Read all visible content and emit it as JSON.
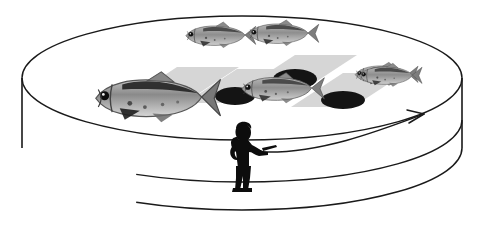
{
  "figure": {
    "kind": "illustration",
    "background_color": "#ffffff",
    "line_color": "#1a1a1a",
    "canvas": {
      "width": 482,
      "height": 243
    }
  },
  "tank": {
    "name": "circular-observation-tank",
    "shape": "cylinder",
    "stroke_color": "#1a1a1a",
    "stroke_width": 1.4,
    "fill_color": "none",
    "top_rim": {
      "cx": 242,
      "cy": 78,
      "rx": 220,
      "ry": 62
    },
    "inner_rim": {
      "cx": 242,
      "cy": 120,
      "rx": 220,
      "ry": 62
    },
    "bottom_rim": {
      "cx": 242,
      "cy": 148,
      "rx": 220,
      "ry": 62
    },
    "wall_left_x": 22,
    "wall_right_x": 462
  },
  "patches": {
    "name": "substrate-patches",
    "fill_color": "#d4d4d4",
    "count": 4,
    "items": [
      {
        "label": "patch-1",
        "cx": 182,
        "cy": 84,
        "w": 62,
        "h": 34,
        "skew": 26
      },
      {
        "label": "patch-2",
        "cx": 242,
        "cy": 86,
        "w": 62,
        "h": 34,
        "skew": 26
      },
      {
        "label": "patch-3",
        "cx": 300,
        "cy": 72,
        "w": 62,
        "h": 34,
        "skew": 26
      },
      {
        "label": "patch-4",
        "cx": 348,
        "cy": 90,
        "w": 62,
        "h": 34,
        "skew": 26
      }
    ]
  },
  "holes": {
    "name": "dark-ellipses",
    "fill_color": "#141414",
    "count": 4,
    "items": [
      {
        "label": "hole-1",
        "cx": 175,
        "cy": 93,
        "rx": 19,
        "ry": 8
      },
      {
        "label": "hole-2",
        "cx": 235,
        "cy": 96,
        "rx": 20,
        "ry": 9
      },
      {
        "label": "hole-3",
        "cx": 295,
        "cy": 79,
        "rx": 22,
        "ry": 10
      },
      {
        "label": "hole-4",
        "cx": 343,
        "cy": 100,
        "rx": 22,
        "ry": 9
      }
    ]
  },
  "fish": {
    "name": "fish-group",
    "body_color": "#9a9a9a",
    "body_color_dark": "#5f5f5f",
    "accent_color": "#161616",
    "count": 6,
    "items": [
      {
        "label": "fish-top-left",
        "cx": 219,
        "cy": 35,
        "length": 42,
        "facing": "left",
        "scale": 1.0
      },
      {
        "label": "fish-top-right",
        "cx": 282,
        "cy": 33,
        "length": 42,
        "facing": "left",
        "scale": 1.0
      },
      {
        "label": "fish-large-left",
        "cx": 155,
        "cy": 97,
        "length": 74,
        "facing": "left",
        "scale": 1.75
      },
      {
        "label": "fish-mid",
        "cx": 281,
        "cy": 88,
        "length": 50,
        "facing": "left",
        "scale": 1.18
      },
      {
        "label": "fish-right",
        "cx": 385,
        "cy": 74,
        "length": 38,
        "facing": "left",
        "scale": 0.9
      },
      {
        "label": "fish-far-right",
        "cx": 389,
        "cy": 75,
        "length": 38,
        "facing": "left",
        "scale": 0.9
      }
    ]
  },
  "observer": {
    "name": "observer-silhouette",
    "fill_color": "#0d0d0d",
    "x": 232,
    "y": 122,
    "width": 40,
    "height": 68,
    "pose": "standing, left hand on hip, right arm extended pointing right",
    "holding": "clipboard-or-pointer"
  },
  "arrow": {
    "name": "sweep-arrow",
    "stroke_color": "#1a1a1a",
    "stroke_width": 1.5,
    "from": {
      "x": 262,
      "y": 152
    },
    "to": {
      "x": 424,
      "y": 114
    },
    "curve": "arc sweeping right and up",
    "arrowhead": "open-v",
    "description": "direction of observation sweep across the tank"
  }
}
